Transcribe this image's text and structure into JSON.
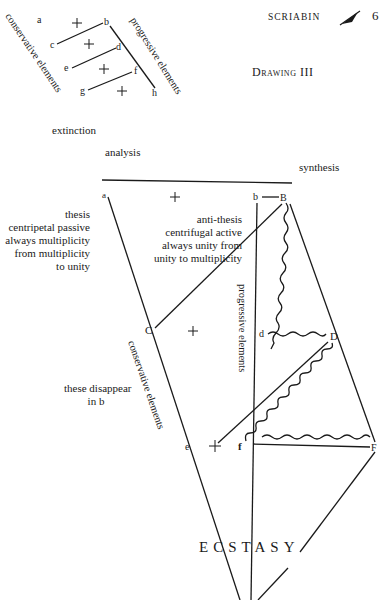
{
  "header": {
    "running_title": "SCRIABIN",
    "ornament": "quill-icon",
    "page_number": "6"
  },
  "title": "Drawing III",
  "small_diagram": {
    "nodes": [
      "a",
      "b",
      "c",
      "d",
      "e",
      "f",
      "g",
      "h"
    ],
    "plus_marks": 4,
    "left_label": "conservative elements",
    "right_label": "progressive elements"
  },
  "labels": {
    "extinction": "extinction",
    "analysis": "analysis",
    "synthesis": "synthesis",
    "thesis": [
      "thesis",
      "centripetal passive",
      "always multiplicity",
      "from multiplicity",
      "to unity"
    ],
    "antithesis": [
      "anti-thesis",
      "centrifugal active",
      "always unity from",
      "unity to multiplicity"
    ],
    "disappear": [
      "these disappear",
      "in b"
    ],
    "progressive": "progressive elements",
    "conservative": "conservative elements",
    "ecstasy": "ECSTASY"
  },
  "main_diagram": {
    "nodes": [
      "a",
      "b",
      "B",
      "C",
      "d",
      "D",
      "e",
      "f",
      "F"
    ],
    "plus_marks": 3
  }
}
